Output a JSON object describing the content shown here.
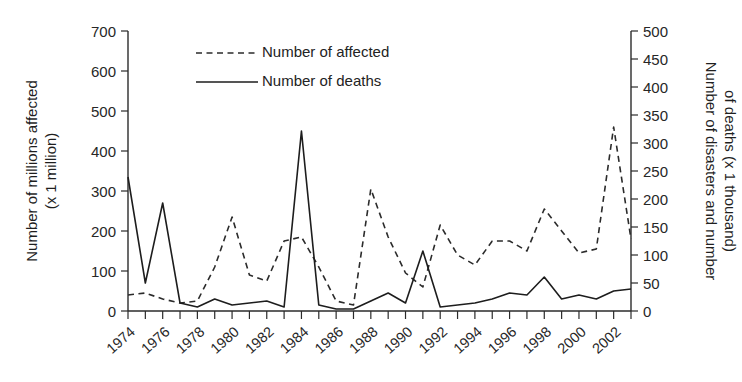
{
  "chart_data": {
    "type": "line",
    "title": "",
    "xlabel": "",
    "grid": false,
    "legend_position": "top-left-inside",
    "x": [
      1974,
      1975,
      1976,
      1977,
      1978,
      1979,
      1980,
      1981,
      1982,
      1983,
      1984,
      1985,
      1986,
      1987,
      1988,
      1989,
      1990,
      1991,
      1992,
      1993,
      1994,
      1995,
      1996,
      1997,
      1998,
      1999,
      2000,
      2001,
      2002,
      2003
    ],
    "x_tick_labels": [
      "1974",
      "1976",
      "1978",
      "1980",
      "1982",
      "1984",
      "1986",
      "1988",
      "1990",
      "1992",
      "1994",
      "1996",
      "1998",
      "2000",
      "2002"
    ],
    "x_tick_label_step_years": 2,
    "xlim": [
      1974,
      2003
    ],
    "left_axis": {
      "label": "Number of millions affected (x 1 million)",
      "label_line1": "Number of millions affected",
      "label_line2": "(x 1 million)",
      "ticks": [
        0,
        100,
        200,
        300,
        400,
        500,
        600,
        700
      ],
      "ylim": [
        0,
        700
      ],
      "unit": "million"
    },
    "right_axis": {
      "label": "Number of disasters and number of deaths (x 1 thousand)",
      "label_line1": "Number of disasters and number",
      "label_line2": "of deaths (x 1 thousand)",
      "ticks": [
        0,
        50,
        100,
        150,
        200,
        250,
        300,
        350,
        400,
        450,
        500
      ],
      "ylim": [
        0,
        500
      ],
      "unit": "thousand"
    },
    "series": [
      {
        "name": "Number of affected",
        "legend_label": "Number of affected",
        "axis": "left",
        "style": "dashed",
        "color": "#2b2b2b",
        "values": [
          40,
          45,
          30,
          20,
          25,
          110,
          235,
          90,
          75,
          175,
          185,
          110,
          25,
          15,
          305,
          185,
          95,
          60,
          215,
          140,
          115,
          175,
          175,
          150,
          255,
          200,
          145,
          155,
          460,
          180
        ]
      },
      {
        "name": "Number of deaths",
        "legend_label": "Number of deaths",
        "axis": "left",
        "style": "solid",
        "color": "#1d1d1d",
        "values": [
          335,
          70,
          270,
          20,
          10,
          30,
          15,
          20,
          25,
          10,
          450,
          15,
          5,
          5,
          25,
          45,
          20,
          150,
          10,
          15,
          20,
          30,
          45,
          40,
          85,
          30,
          40,
          30,
          50,
          55
        ]
      }
    ],
    "series_right_scale": [
      {
        "name": "Number of deaths",
        "note": "same polyline read on right axis (x 1 thousand)",
        "values": [
          239,
          50,
          193,
          14,
          7,
          21,
          11,
          14,
          18,
          7,
          321,
          11,
          4,
          4,
          18,
          32,
          14,
          107,
          7,
          11,
          14,
          21,
          32,
          29,
          61,
          21,
          29,
          21,
          36,
          39
        ]
      }
    ]
  },
  "legend": {
    "items": [
      {
        "label": "Number of affected",
        "style": "dashed"
      },
      {
        "label": "Number of deaths",
        "style": "solid"
      }
    ]
  }
}
